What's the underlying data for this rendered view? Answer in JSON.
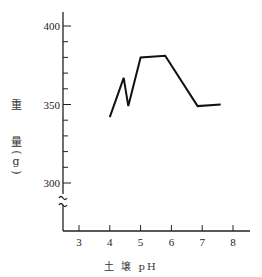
{
  "chart_data": {
    "type": "line",
    "title": "",
    "xlabel": "土 壌 pH",
    "ylabel": "重 量 (g)",
    "ylabel_parts": [
      "重",
      "量",
      "(",
      "g",
      ")"
    ],
    "x": [
      4.0,
      4.45,
      4.6,
      5.0,
      5.8,
      6.85,
      7.6
    ],
    "values": [
      342,
      367,
      349,
      380,
      381,
      349,
      350
    ],
    "xticks": [
      3,
      4,
      5,
      6,
      7,
      8
    ],
    "yticks": [
      300,
      350,
      400
    ],
    "xlim": [
      2.5,
      8.5
    ],
    "ylim": [
      290,
      410
    ],
    "axis_break": true,
    "grid": false,
    "legend": null
  },
  "axis": {
    "y_tick_labels": [
      "400",
      "350",
      "300"
    ],
    "x_tick_labels": [
      "3",
      "4",
      "5",
      "6",
      "7",
      "8"
    ]
  }
}
